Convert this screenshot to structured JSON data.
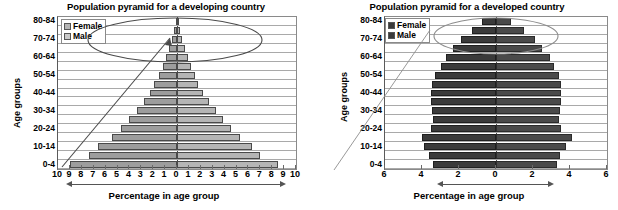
{
  "charts": [
    {
      "id": "developing",
      "title": "Population pyramid for a developing country",
      "xlabel": "Percentage in age group",
      "ylabel": "Age groups",
      "legend": {
        "female": "Female",
        "male": "Male"
      },
      "xticks": [
        "10",
        "9",
        "8",
        "7",
        "6",
        "5",
        "4",
        "3",
        "2",
        "1",
        "0",
        "1",
        "2",
        "3",
        "4",
        "5",
        "6",
        "7",
        "8",
        "9",
        "10"
      ]
    },
    {
      "id": "developed",
      "title": "Population pyramid for a developed country",
      "xlabel": "Percentage in age group",
      "ylabel": "Age groups",
      "legend": {
        "female": "Female",
        "male": "Male"
      },
      "xticks": [
        "6",
        "4",
        "2",
        "0",
        "2",
        "4",
        "6"
      ]
    }
  ],
  "chart_data": [
    {
      "type": "bar",
      "id": "developing",
      "title": "Population pyramid for a developing country",
      "subtitle": "",
      "orientation": "horizontal-diverging",
      "xlabel": "Percentage in age group",
      "ylabel": "Age groups",
      "xlim": [
        -10,
        10
      ],
      "xtick_labels": [
        "10",
        "9",
        "8",
        "7",
        "6",
        "5",
        "4",
        "3",
        "2",
        "1",
        "0",
        "1",
        "2",
        "3",
        "4",
        "5",
        "6",
        "7",
        "8",
        "9",
        "10"
      ],
      "xtick_values": [
        -10,
        -9,
        -8,
        -7,
        -6,
        -5,
        -4,
        -3,
        -2,
        -1,
        0,
        1,
        2,
        3,
        4,
        5,
        6,
        7,
        8,
        9,
        10
      ],
      "grid": true,
      "legend_position": "top-left",
      "categories": [
        "0-4",
        "5-9",
        "10-14",
        "15-19",
        "20-24",
        "25-29",
        "30-34",
        "35-39",
        "40-44",
        "45-49",
        "50-54",
        "55-59",
        "60-64",
        "65-69",
        "70-74",
        "75-79",
        "80-84"
      ],
      "series": [
        {
          "name": "Male",
          "side": "left",
          "values": [
            9.0,
            7.4,
            6.6,
            5.5,
            4.7,
            4.0,
            3.4,
            2.8,
            2.3,
            1.9,
            1.5,
            1.2,
            0.9,
            0.65,
            0.45,
            0.25,
            0.1
          ]
        },
        {
          "name": "Female",
          "side": "right",
          "values": [
            8.5,
            7.0,
            6.3,
            5.3,
            4.5,
            3.9,
            3.3,
            2.7,
            2.2,
            1.8,
            1.5,
            1.2,
            0.9,
            0.65,
            0.45,
            0.25,
            0.1
          ]
        }
      ],
      "annotations": [
        {
          "type": "ellipse",
          "note": "ellipse highlighting the narrow top of the pyramid"
        },
        {
          "type": "arrow",
          "note": "arrow pointing from lower-left up to the ellipsed apex"
        }
      ]
    },
    {
      "type": "bar",
      "id": "developed",
      "title": "Population pyramid for a developed country",
      "subtitle": "",
      "orientation": "horizontal-diverging",
      "xlabel": "Percentage in age group",
      "ylabel": "Age groups",
      "xlim": [
        -6,
        6
      ],
      "xtick_labels": [
        "6",
        "4",
        "2",
        "0",
        "2",
        "4",
        "6"
      ],
      "xtick_values": [
        -6,
        -4,
        -2,
        0,
        2,
        4,
        6
      ],
      "grid": true,
      "legend_position": "top-left",
      "categories": [
        "0-4",
        "5-9",
        "10-14",
        "15-19",
        "20-24",
        "25-29",
        "30-34",
        "35-39",
        "40-44",
        "45-49",
        "50-54",
        "55-59",
        "60-64",
        "65-69",
        "70-74",
        "75-79",
        "80-84"
      ],
      "series": [
        {
          "name": "Male",
          "side": "left",
          "values": [
            3.4,
            3.6,
            3.9,
            4.0,
            3.5,
            3.4,
            3.45,
            3.5,
            3.5,
            3.45,
            3.3,
            3.0,
            2.7,
            2.3,
            1.9,
            1.3,
            0.75
          ]
        },
        {
          "name": "Female",
          "side": "right",
          "values": [
            3.3,
            3.45,
            3.8,
            4.1,
            3.5,
            3.4,
            3.45,
            3.5,
            3.5,
            3.5,
            3.4,
            3.15,
            2.9,
            2.5,
            2.1,
            1.5,
            0.8
          ]
        }
      ],
      "annotations": [
        {
          "type": "ellipse",
          "note": "ellipse highlighting the broad top of the pyramid"
        },
        {
          "type": "line",
          "note": "faint diagonal guide line along the left profile"
        }
      ]
    }
  ],
  "colors": {
    "developing_female": "#b5b5b5",
    "developing_male": "#9d9d9d",
    "developed_female": "#4a4a4a",
    "developed_male": "#3a3a3a",
    "grid": "#a9a9a9",
    "axis": "#555555"
  }
}
